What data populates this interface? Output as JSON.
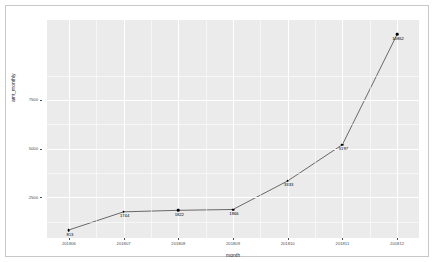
{
  "chart_data": {
    "type": "line",
    "title": "",
    "xlabel": "month",
    "ylabel": "amt_monthly",
    "categories": [
      "201806",
      "201807",
      "201808",
      "201809",
      "201810",
      "201811",
      "201812"
    ],
    "values": [
      813,
      1744,
      1822,
      1866,
      3333,
      5197,
      10862
    ],
    "point_labels": [
      "813",
      "1744",
      "1822",
      "1866",
      "3333",
      "5197",
      "10862"
    ],
    "ytick_labels": [
      "2500",
      "5000",
      "7500"
    ],
    "ytick_values": [
      2500,
      5000,
      7500
    ],
    "xtick_labels": [
      "201806",
      "201807",
      "201808",
      "201809",
      "201810",
      "201811",
      "201812"
    ],
    "ylim": [
      400,
      11600
    ],
    "xlim": [
      0.6,
      7.4
    ],
    "grid": true,
    "legend": "none",
    "series": [
      {
        "name": "amt_monthly",
        "values": [
          813,
          1744,
          1822,
          1866,
          3333,
          5197,
          10862
        ]
      }
    ],
    "colors": {
      "panel_background": "#ebebeb",
      "grid_line": "#ffffff",
      "line": "#595959",
      "point": "#000000",
      "text": "#4d4d4d",
      "frame": "#c8c8c8"
    }
  }
}
